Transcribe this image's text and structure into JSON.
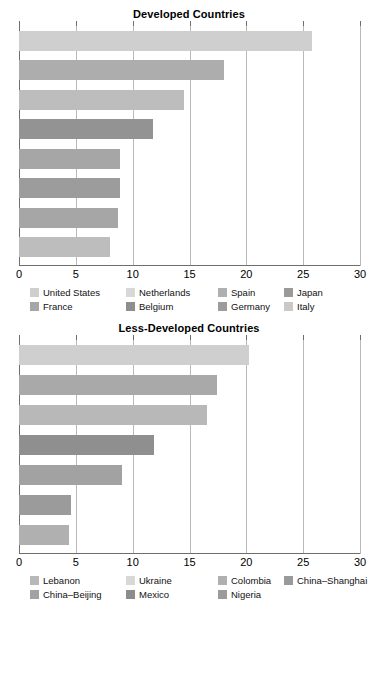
{
  "page": {
    "background": "#ffffff",
    "axis_color": "#6e6e6e",
    "grid_color": "#b9b9b9"
  },
  "chart_data": [
    {
      "id": "developed",
      "type": "bar",
      "orientation": "horizontal",
      "title": "Developed Countries",
      "xlabel": "",
      "ylabel": "",
      "xlim": [
        0,
        30
      ],
      "xticks": [
        0,
        5,
        10,
        15,
        20,
        25,
        30
      ],
      "xtick_labels": [
        "0",
        "5",
        "10",
        "15",
        "20",
        "25",
        "30"
      ],
      "grid": true,
      "grid_axis": "x",
      "legend_position": "bottom",
      "legend_columns": 4,
      "categories": [
        "United States",
        "Netherlands",
        "Spain",
        "Japan",
        "France",
        "Belgium",
        "Germany",
        "Italy"
      ],
      "values": [
        25.8,
        18.0,
        14.5,
        11.8,
        8.9,
        8.9,
        8.7,
        8.0
      ],
      "colors": [
        "#cfcfcf",
        "#adadad",
        "#bdbdbd",
        "#939393",
        "#a6a6a6",
        "#9c9c9c",
        "#a6a6a6",
        "#bdbdbd"
      ],
      "legend": [
        {
          "label": "United States",
          "color": "#cfcfcf"
        },
        {
          "label": "Netherlands",
          "color": "#d8d8d8"
        },
        {
          "label": "Spain",
          "color": "#b0b0b0"
        },
        {
          "label": "Japan",
          "color": "#9a9a9a"
        },
        {
          "label": "France",
          "color": "#a6a6a6"
        },
        {
          "label": "Belgium",
          "color": "#8e8e8e"
        },
        {
          "label": "Germany",
          "color": "#9c9c9c"
        },
        {
          "label": "Italy",
          "color": "#c9c9c9"
        }
      ]
    },
    {
      "id": "less-developed",
      "type": "bar",
      "orientation": "horizontal",
      "title": "Less-Developed Countries",
      "xlabel": "",
      "ylabel": "",
      "xlim": [
        0,
        30
      ],
      "xticks": [
        0,
        5,
        10,
        15,
        20,
        25,
        30
      ],
      "xtick_labels": [
        "0",
        "5",
        "10",
        "15",
        "20",
        "25",
        "30"
      ],
      "grid": true,
      "grid_axis": "x",
      "legend_position": "bottom",
      "legend_columns": 4,
      "categories": [
        "Lebanon",
        "Ukraine",
        "Colombia",
        "China–Shanghai",
        "China–Beijing",
        "Mexico",
        "Nigeria"
      ],
      "values": [
        20.2,
        17.4,
        16.5,
        11.9,
        9.1,
        4.6,
        4.4
      ],
      "colors": [
        "#cfcfcf",
        "#a9a9a9",
        "#b8b8b8",
        "#8f8f8f",
        "#a2a2a2",
        "#9b9b9b",
        "#b0b0b0"
      ],
      "legend": [
        {
          "label": "Lebanon",
          "color": "#b8b8b8"
        },
        {
          "label": "Ukraine",
          "color": "#d8d8d8"
        },
        {
          "label": "Colombia",
          "color": "#b0b0b0"
        },
        {
          "label": "China–Shanghai",
          "color": "#9a9a9a"
        },
        {
          "label": "China–Beijing",
          "color": "#a2a2a2"
        },
        {
          "label": "Mexico",
          "color": "#8c8c8c"
        },
        {
          "label": "Nigeria",
          "color": "#9b9b9b"
        }
      ]
    }
  ]
}
